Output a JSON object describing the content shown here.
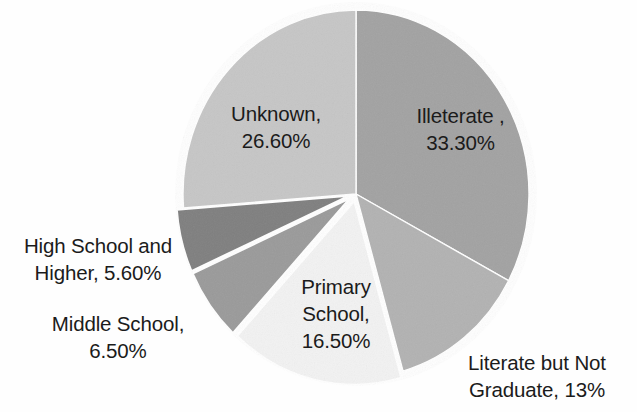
{
  "chart_data": {
    "type": "pie",
    "title": "",
    "subtitle": "",
    "xlabel": "",
    "ylabel": "",
    "legend_position": "none",
    "grid": false,
    "labels_on_slices": true,
    "categories": [
      "Illeterate ",
      "Literate but Not Graduate",
      "Primary School",
      "Middle School",
      "High School and Higher",
      "Unknown"
    ],
    "values": [
      33.3,
      13,
      16.5,
      6.5,
      5.6,
      26.6
    ],
    "value_texts": [
      "33.30%",
      "13%",
      "16.50%",
      "6.50%",
      "5.60%",
      "26.60%"
    ],
    "slice_colors": [
      "#a2a2a2",
      "#b2b2b2",
      "#f2f2f2",
      "#9a9a9a",
      "#7f7f7f",
      "#c6c6c6"
    ],
    "start_angle_deg": 0,
    "direction": "clockwise",
    "slices": [
      {
        "name": "Illeterate ",
        "value": 33.3,
        "value_text": "33.30%",
        "label_text": "Illeterate ,\n33.30%",
        "color": "#a2a2a2",
        "exploded": false
      },
      {
        "name": "Literate but Not Graduate",
        "value": 13,
        "value_text": "13%",
        "label_text": "Literate but Not\nGraduate, 13%",
        "color": "#b2b2b2",
        "exploded": false
      },
      {
        "name": "Primary School",
        "value": 16.5,
        "value_text": "16.50%",
        "label_text": "Primary\nSchool,\n16.50%",
        "color": "#f2f2f2",
        "exploded": true
      },
      {
        "name": "Middle School",
        "value": 6.5,
        "value_text": "6.50%",
        "label_text": "Middle School,\n6.50%",
        "color": "#9a9a9a",
        "exploded": true
      },
      {
        "name": "High School and Higher",
        "value": 5.6,
        "value_text": "5.60%",
        "label_text": "High School and\nHigher, 5.60%",
        "color": "#7f7f7f",
        "exploded": true
      },
      {
        "name": "Unknown",
        "value": 26.6,
        "value_text": "26.60%",
        "label_text": "Unknown,\n26.60%",
        "color": "#c6c6c6",
        "exploded": false
      }
    ]
  },
  "style": {
    "background": "#fefefe",
    "text_color": "#1b1b1b",
    "outline_color": "#ffffff"
  }
}
